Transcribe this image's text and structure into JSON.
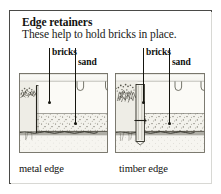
{
  "figure": {
    "title": "Edge retainers",
    "subtitle": "These help to hold bricks in place.",
    "border_color": "#4a4a47",
    "background": "#ffffff",
    "ink_color": "#15150f"
  },
  "callouts": {
    "left": {
      "bricks": "bricks",
      "sand": "sand"
    },
    "right": {
      "bricks": "bricks",
      "sand": "sand"
    }
  },
  "panels": [
    {
      "id": "metal-edge",
      "caption": "metal edge",
      "edge_type": "metal",
      "layers": [
        "bricks",
        "sand",
        "subsoil"
      ]
    },
    {
      "id": "timber-edge",
      "caption": "timber edge",
      "edge_type": "timber",
      "layers": [
        "bricks",
        "sand",
        "subsoil"
      ]
    }
  ]
}
